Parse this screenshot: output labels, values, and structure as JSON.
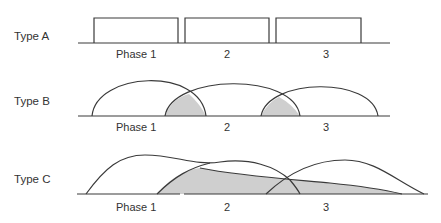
{
  "diagram": {
    "rows": [
      {
        "label": "Type A",
        "style": "sequential rectangles",
        "phases": [
          "Phase 1",
          "2",
          "3"
        ]
      },
      {
        "label": "Type B",
        "style": "overlapping arcs with shaded overlaps",
        "phases": [
          "Phase 1",
          "2",
          "3"
        ]
      },
      {
        "label": "Type C",
        "style": "overlapping skewed curves with large shaded overlap",
        "phases": [
          "Phase 1",
          "2",
          "3"
        ]
      }
    ],
    "colors": {
      "line": "#3a3a3a",
      "shade": "#cfcfcf",
      "text": "#333333",
      "background": "#ffffff"
    }
  }
}
